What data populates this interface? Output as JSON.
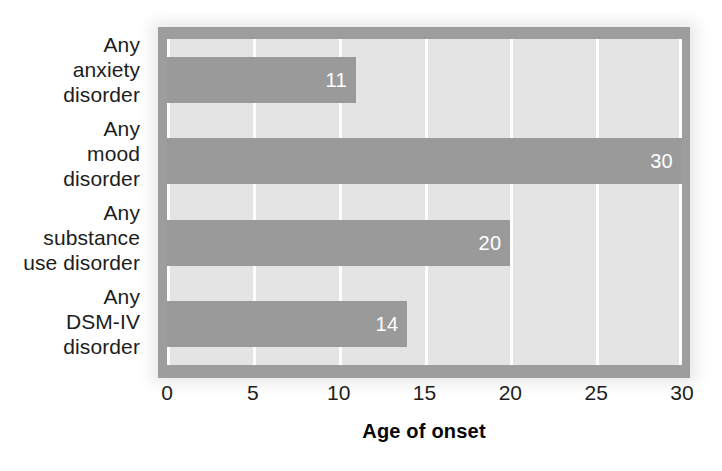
{
  "chart_data": {
    "type": "bar",
    "orientation": "horizontal",
    "title": "",
    "subtitle": "",
    "xlabel": "Age of onset",
    "ylabel": "",
    "categories": [
      "Any anxiety disorder",
      "Any mood disorder",
      "Any substance use disorder",
      "Any DSM-IV disorder"
    ],
    "category_lines": [
      [
        "Any",
        "anxiety",
        "disorder"
      ],
      [
        "Any",
        "mood",
        "disorder"
      ],
      [
        "Any",
        "substance",
        "use disorder"
      ],
      [
        "Any",
        "DSM-IV",
        "disorder"
      ]
    ],
    "values": [
      11,
      30,
      20,
      14
    ],
    "value_labels": [
      "11",
      "30",
      "20",
      "14"
    ],
    "xlim": [
      0,
      30
    ],
    "xticks": [
      0,
      5,
      10,
      15,
      20,
      25,
      30
    ],
    "xtick_labels": [
      "0",
      "5",
      "10",
      "15",
      "20",
      "25",
      "30"
    ],
    "grid": "vertical",
    "legend": "none",
    "colors": {
      "bar": "#9a9a9a",
      "plot_background": "#e4e4e4",
      "gridline": "#fdfdfd",
      "frame": "#9d9d9d",
      "value_label": "#ffffff",
      "axis_text": "#1d1d1d",
      "axis_title": "#060606",
      "page_background": "#ffffff"
    }
  }
}
